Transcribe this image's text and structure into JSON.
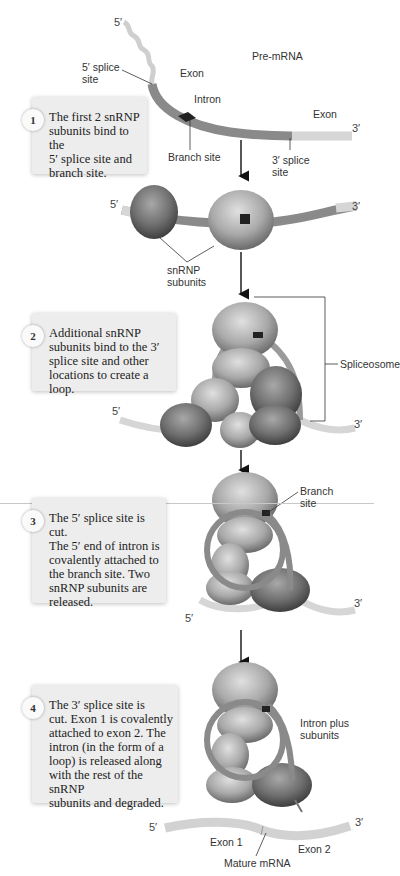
{
  "title": "Pre-mRNA",
  "labels": {
    "five_prime": "5′",
    "three_prime": "3′",
    "five_splice_site": "5′ splice\nsite",
    "exon_top": "Exon",
    "intron": "Intron",
    "exon_right": "Exon",
    "branch_site": "Branch site",
    "three_splice_site": "3′ splice\nsite",
    "snrnp_subunits": "snRNP\nsubunits",
    "spliceosome": "Spliceosome",
    "branch_site_2": "Branch\nsite",
    "intron_plus_subunits": "Intron plus\nsubunits",
    "exon1": "Exon 1",
    "exon2": "Exon 2",
    "mature_mrna": "Mature mRNA"
  },
  "steps": [
    {
      "number": "1",
      "text": "The first 2 snRNP\nsubunits bind to the\n5′ splice site and\nbranch site."
    },
    {
      "number": "2",
      "text": "Additional snRNP\nsubunits bind to the 3′\nsplice site and other\nlocations to create a loop."
    },
    {
      "number": "3",
      "text": "The 5′ splice site is cut.\nThe 5′ end of intron is\ncovalently attached to\nthe branch site. Two\nsnRNP subunits are\nreleased."
    },
    {
      "number": "4",
      "text": "The 3′ splice site is\ncut. Exon 1 is covalently\nattached to exon 2. The\nintron (in the form of a\nloop) is released along\nwith the rest of the snRNP\nsubunits and degraded."
    }
  ],
  "colors": {
    "exon": "#d2d2d2",
    "intron": "#8a8a8a",
    "branch": "#222222",
    "snrnp_dark": "#6e6e6e",
    "snrnp_light": "#b5b5b5",
    "box": "#ededed"
  }
}
